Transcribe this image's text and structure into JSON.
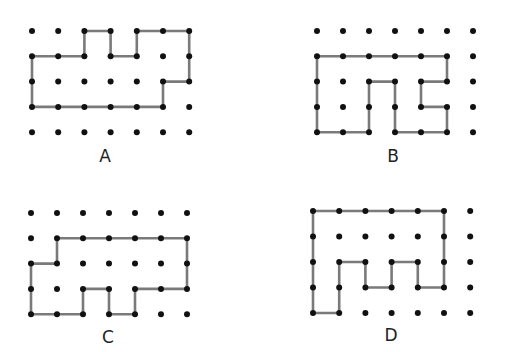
{
  "figures": [
    {
      "label": "A",
      "label_pos": [
        105,
        156
      ],
      "grid": {
        "cols": 7,
        "rows": 5,
        "x0": 32,
        "y0": 31,
        "dx": 26.2,
        "dy": 25.3
      },
      "path": [
        [
          2,
          0
        ],
        [
          3,
          0
        ],
        [
          3,
          1
        ],
        [
          4,
          1
        ],
        [
          4,
          0
        ],
        [
          5,
          0
        ],
        [
          6,
          0
        ],
        [
          6,
          1
        ],
        [
          6,
          2
        ],
        [
          5,
          2
        ],
        [
          5,
          3
        ],
        [
          4,
          3
        ],
        [
          3,
          3
        ],
        [
          2,
          3
        ],
        [
          1,
          3
        ],
        [
          0,
          3
        ],
        [
          0,
          2
        ],
        [
          0,
          1
        ],
        [
          1,
          1
        ],
        [
          2,
          1
        ],
        [
          2,
          0
        ]
      ]
    },
    {
      "label": "B",
      "label_pos": [
        393,
        156
      ],
      "grid": {
        "cols": 7,
        "rows": 5,
        "x0": 317,
        "y0": 31,
        "dx": 26.0,
        "dy": 25.3
      },
      "path": [
        [
          0,
          1
        ],
        [
          1,
          1
        ],
        [
          2,
          1
        ],
        [
          3,
          1
        ],
        [
          4,
          1
        ],
        [
          5,
          1
        ],
        [
          5,
          2
        ],
        [
          4,
          2
        ],
        [
          4,
          3
        ],
        [
          5,
          3
        ],
        [
          5,
          4
        ],
        [
          4,
          4
        ],
        [
          3,
          4
        ],
        [
          3,
          3
        ],
        [
          3,
          2
        ],
        [
          2,
          2
        ],
        [
          2,
          3
        ],
        [
          2,
          4
        ],
        [
          1,
          4
        ],
        [
          0,
          4
        ],
        [
          0,
          3
        ],
        [
          0,
          2
        ],
        [
          0,
          1
        ]
      ]
    },
    {
      "label": "C",
      "label_pos": [
        108,
        337
      ],
      "grid": {
        "cols": 7,
        "rows": 5,
        "x0": 31,
        "y0": 213,
        "dx": 26.0,
        "dy": 25.3
      },
      "path": [
        [
          1,
          1
        ],
        [
          2,
          1
        ],
        [
          3,
          1
        ],
        [
          4,
          1
        ],
        [
          5,
          1
        ],
        [
          6,
          1
        ],
        [
          6,
          2
        ],
        [
          6,
          3
        ],
        [
          5,
          3
        ],
        [
          4,
          3
        ],
        [
          4,
          4
        ],
        [
          3,
          4
        ],
        [
          3,
          3
        ],
        [
          2,
          3
        ],
        [
          2,
          4
        ],
        [
          1,
          4
        ],
        [
          0,
          4
        ],
        [
          0,
          3
        ],
        [
          0,
          2
        ],
        [
          1,
          2
        ],
        [
          1,
          1
        ]
      ]
    },
    {
      "label": "D",
      "label_pos": [
        391,
        335
      ],
      "grid": {
        "cols": 7,
        "rows": 5,
        "x0": 313,
        "y0": 211,
        "dx": 26.2,
        "dy": 25.5
      },
      "path": [
        [
          0,
          0
        ],
        [
          1,
          0
        ],
        [
          2,
          0
        ],
        [
          3,
          0
        ],
        [
          4,
          0
        ],
        [
          5,
          0
        ],
        [
          5,
          1
        ],
        [
          5,
          2
        ],
        [
          5,
          3
        ],
        [
          4,
          3
        ],
        [
          4,
          2
        ],
        [
          3,
          2
        ],
        [
          3,
          3
        ],
        [
          2,
          3
        ],
        [
          2,
          2
        ],
        [
          1,
          2
        ],
        [
          1,
          3
        ],
        [
          1,
          4
        ],
        [
          0,
          4
        ],
        [
          0,
          3
        ],
        [
          0,
          2
        ],
        [
          0,
          1
        ],
        [
          0,
          0
        ]
      ]
    }
  ],
  "colors": {
    "line": "#7a7a7a",
    "dot": "#111111",
    "label": "#222222",
    "background": "#ffffff"
  }
}
